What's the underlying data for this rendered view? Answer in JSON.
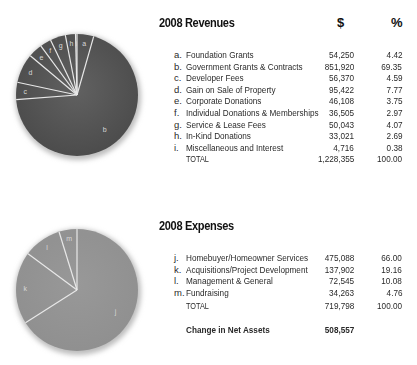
{
  "revenues": {
    "title": "2008 Revenues",
    "col_amount": "$",
    "col_pct": "%",
    "rows": [
      {
        "letter": "a.",
        "label": "Foundation Grants",
        "amount": "54,250",
        "pct": "4.42"
      },
      {
        "letter": "b.",
        "label": "Government Grants & Contracts",
        "amount": "851,920",
        "pct": "69.35"
      },
      {
        "letter": "c.",
        "label": "Developer Fees",
        "amount": "56,370",
        "pct": "4.59"
      },
      {
        "letter": "d.",
        "label": "Gain on Sale of Property",
        "amount": "95,422",
        "pct": "7.77"
      },
      {
        "letter": "e.",
        "label": "Corporate Donations",
        "amount": "46,108",
        "pct": "3.75"
      },
      {
        "letter": "f.",
        "label": "Individual Donations & Memberships",
        "amount": "36,505",
        "pct": "2.97"
      },
      {
        "letter": "g.",
        "label": "Service & Lease Fees",
        "amount": "50,043",
        "pct": "4.07"
      },
      {
        "letter": "h.",
        "label": "In-Kind Donations",
        "amount": "33,021",
        "pct": "2.69"
      },
      {
        "letter": "i.",
        "label": "Miscellaneous and Interest",
        "amount": "4,716",
        "pct": "0.38"
      }
    ],
    "total": {
      "label": "TOTAL",
      "amount": "1,228,355",
      "pct": "100.00"
    }
  },
  "expenses": {
    "title": "2008 Expenses",
    "rows": [
      {
        "letter": "j.",
        "label": "Homebuyer/Homeowner Services",
        "amount": "475,088",
        "pct": "66.00"
      },
      {
        "letter": "k.",
        "label": "Acquisitions/Project Development",
        "amount": "137,902",
        "pct": "19.16"
      },
      {
        "letter": "l.",
        "label": "Management & General",
        "amount": "72,545",
        "pct": "10.08"
      },
      {
        "letter": "m.",
        "label": "Fundraising",
        "amount": "34,263",
        "pct": "4.76"
      }
    ],
    "total": {
      "label": "TOTAL",
      "amount": "719,798",
      "pct": "100.00"
    },
    "net": {
      "label": "Change in Net Assets",
      "amount": "508,557"
    }
  },
  "colors": {
    "revenue_pie": "#4a4a4a",
    "expense_pie": "#8f8f8f",
    "divider": "#e8e8e8",
    "slice_label": "#d8d8d8"
  },
  "chart_data": [
    {
      "type": "pie",
      "title": "2008 Revenues",
      "categories": [
        "a",
        "b",
        "c",
        "d",
        "e",
        "f",
        "g",
        "h",
        "i"
      ],
      "legend": [
        "Foundation Grants",
        "Government Grants & Contracts",
        "Developer Fees",
        "Gain on Sale of Property",
        "Corporate Donations",
        "Individual Donations & Memberships",
        "Service & Lease Fees",
        "In-Kind Donations",
        "Miscellaneous and Interest"
      ],
      "values": [
        54250,
        851920,
        56370,
        95422,
        46108,
        36505,
        50043,
        33021,
        4716
      ],
      "percentages": [
        4.42,
        69.35,
        4.59,
        7.77,
        3.75,
        2.97,
        4.07,
        2.69,
        0.38
      ],
      "total": 1228355
    },
    {
      "type": "pie",
      "title": "2008 Expenses",
      "categories": [
        "j",
        "k",
        "l",
        "m"
      ],
      "legend": [
        "Homebuyer/Homeowner Services",
        "Acquisitions/Project Development",
        "Management & General",
        "Fundraising"
      ],
      "values": [
        475088,
        137902,
        72545,
        34263
      ],
      "percentages": [
        66.0,
        19.16,
        10.08,
        4.76
      ],
      "total": 719798
    }
  ]
}
